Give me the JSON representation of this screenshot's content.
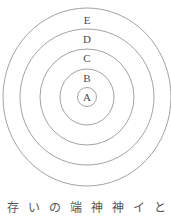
{
  "diagram": {
    "type": "concentric-circles",
    "center": {
      "x": 87,
      "y": 97
    },
    "stroke_color": "#8a8a8a",
    "rings": [
      {
        "label": "A",
        "rx": 9.5,
        "ry": 9.5,
        "label_y": 97
      },
      {
        "label": "B",
        "rx": 27,
        "ry": 28,
        "label_y": 78
      },
      {
        "label": "C",
        "rx": 47,
        "ry": 48,
        "label_y": 58
      },
      {
        "label": "D",
        "rx": 67,
        "ry": 68,
        "label_y": 39
      },
      {
        "label": "E",
        "rx": 84,
        "ry": 89,
        "label_y": 20
      }
    ]
  },
  "caption": {
    "chars": [
      "存",
      "い",
      "の",
      "端",
      "神",
      "神",
      "イ",
      "と"
    ]
  }
}
